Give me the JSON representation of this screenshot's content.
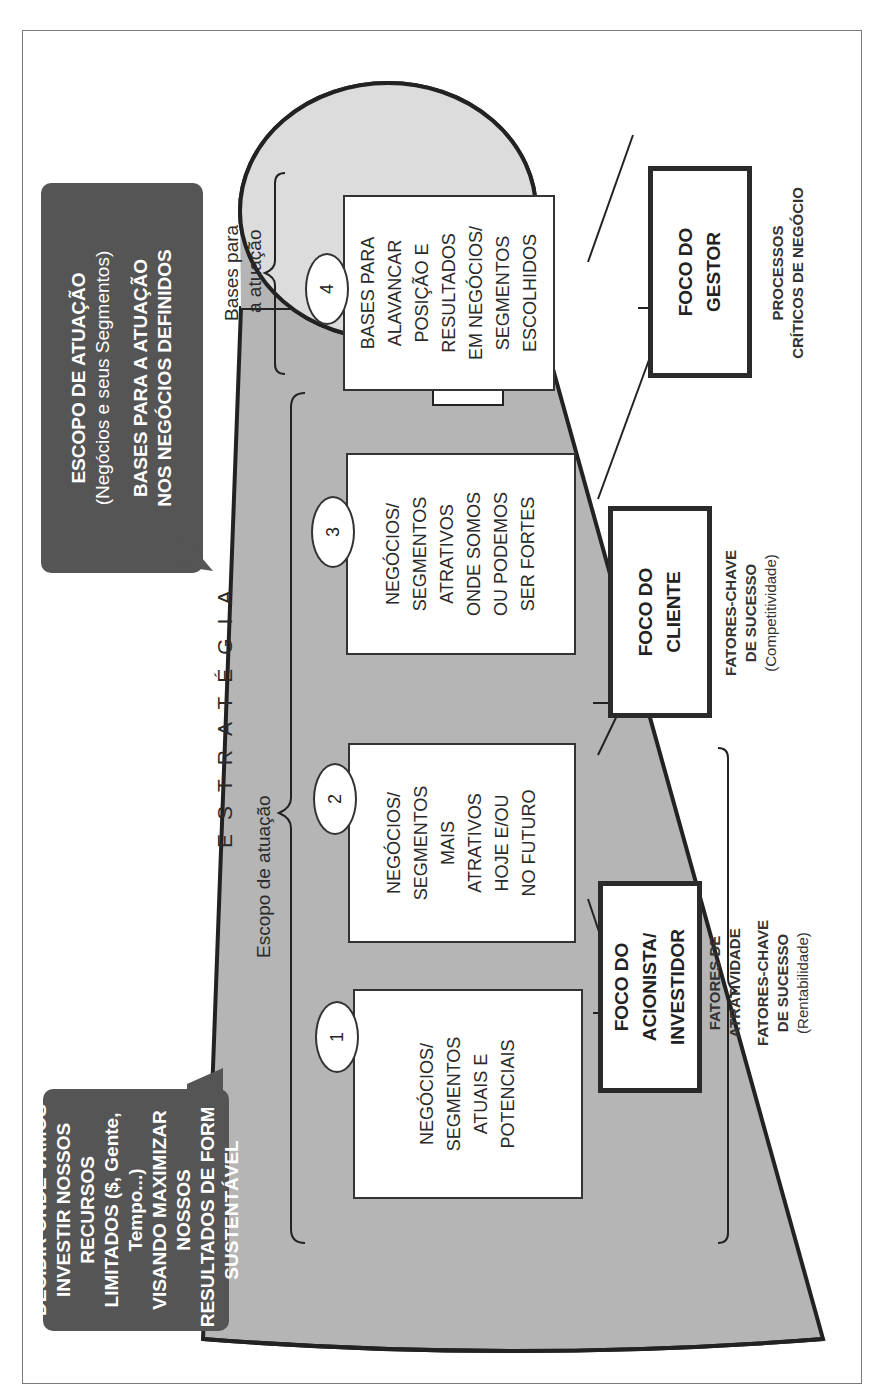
{
  "diagram": {
    "title": "ESTRATÉGIA",
    "colors": {
      "bubble": "#555555",
      "cone_fill": "#b5b5b5",
      "cone_top": "#dcdcdc",
      "stroke": "#222222",
      "frame": "#7a7a7a"
    },
    "bubbles": [
      {
        "lines": [
          "DECIDIR ONDE VAMOS",
          "INVESTIR NOSSOS RECURSOS",
          "LIMITADOS ($, Gente, Tempo...)",
          "VISANDO MAXIMIZAR NOSSOS",
          "RESULTADOS DE FORMA",
          "SUSTENTÁVEL"
        ]
      },
      {
        "title": "ESCOPO DE ATUAÇÃO",
        "subtitle": "(Negócios e seus Segmentos)",
        "title2_line1": "BASES PARA A ATUAÇÃO",
        "title2_line2": "NOS NEGÓCIOS DEFINIDOS"
      }
    ],
    "brackets": {
      "scope_label": "Escopo de atuação",
      "bases_label_line1": "Bases para",
      "bases_label_line2": "a atuação"
    },
    "steps": [
      {
        "number": "1",
        "lines": [
          "NEGÓCIOS/",
          "SEGMENTOS",
          "ATUAIS E",
          "POTENCIAIS"
        ]
      },
      {
        "number": "2",
        "lines": [
          "NEGÓCIOS/",
          "SEGMENTOS",
          "MAIS",
          "ATRATIVOS",
          "HOJE E/OU",
          "NO FUTURO"
        ]
      },
      {
        "number": "3",
        "lines": [
          "NEGÓCIOS/",
          "SEGMENTOS",
          "ATRATIVOS",
          "ONDE SOMOS",
          "OU PODEMOS",
          "SER FORTES"
        ]
      },
      {
        "number": "4",
        "lines": [
          "BASES PARA",
          "ALAVANCAR",
          "POSIÇÃO E",
          "RESULTADOS",
          "EM NEGÓCIOS/",
          "SEGMENTOS",
          "ESCOLHIDOS"
        ]
      }
    ],
    "focus_boxes": [
      {
        "lines": [
          "FOCO DO",
          "ACIONISTA/",
          "INVESTIDOR"
        ],
        "caption_lines": [
          "FATORES DE",
          "ATRATIVIDADE"
        ],
        "caption2_lines": [
          "FATORES-CHAVE",
          "DE SUCESSO"
        ],
        "caption2_sub": "(Rentabilidade)"
      },
      {
        "lines": [
          "FOCO DO",
          "CLIENTE"
        ],
        "caption_lines": [
          "FATORES-CHAVE",
          "DE SUCESSO"
        ],
        "caption_sub": "(Competitividade)"
      },
      {
        "lines": [
          "FOCO DO",
          "GESTOR"
        ],
        "caption_lines": [
          "PROCESSOS",
          "CRÍTICOS DE NEGÓCIO"
        ]
      }
    ]
  }
}
